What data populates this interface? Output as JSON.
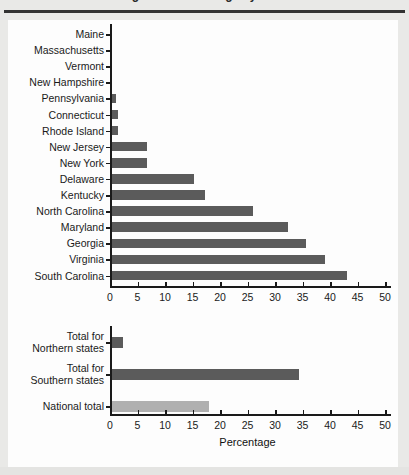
{
  "figure": {
    "cropped_caption": "Figure 1. Percentage by state",
    "x_axis_title": "Percentage"
  },
  "chart_data": [
    {
      "type": "bar",
      "orientation": "horizontal",
      "title": "",
      "xlabel": "",
      "ylabel": "",
      "xlim": [
        0,
        50
      ],
      "xticks": [
        0,
        5,
        10,
        15,
        20,
        25,
        30,
        35,
        40,
        45,
        50
      ],
      "grid": false,
      "legend": "none",
      "bar_color": "#5b5b5b",
      "categories": [
        "Maine",
        "Massachusetts",
        "Vermont",
        "New Hampshire",
        "Pennsylvania",
        "Connecticut",
        "Rhode Island",
        "New Jersey",
        "New York",
        "Delaware",
        "Kentucky",
        "North Carolina",
        "Maryland",
        "Georgia",
        "Virginia",
        "South Carolina"
      ],
      "values": [
        0,
        0,
        0,
        0,
        0.9,
        1.1,
        1.2,
        6.4,
        6.4,
        15.0,
        17.0,
        25.8,
        32.1,
        35.3,
        38.9,
        42.9
      ]
    },
    {
      "type": "bar",
      "orientation": "horizontal",
      "title": "",
      "xlabel": "Percentage",
      "ylabel": "",
      "xlim": [
        0,
        50
      ],
      "xticks": [
        0,
        5,
        10,
        15,
        20,
        25,
        30,
        35,
        40,
        45,
        50
      ],
      "grid": false,
      "legend": "none",
      "categories": [
        "Total for Northern states",
        "Total for Southern states",
        "National total"
      ],
      "values": [
        2.0,
        34.1,
        17.7
      ],
      "colors": [
        "#5b5b5b",
        "#5b5b5b",
        "#b0b0b0"
      ]
    }
  ]
}
